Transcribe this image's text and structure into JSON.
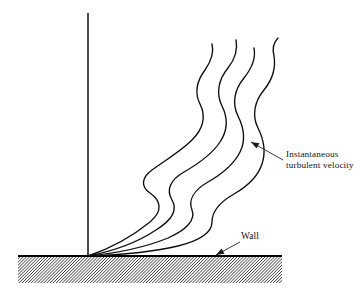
{
  "figure": {
    "background_color": "#ffffff",
    "ink_color": "#111111",
    "width": 362,
    "height": 295
  },
  "annotations": {
    "velocity_label": {
      "line1": "Instantaneous",
      "line2": "turbulent velocity",
      "text_x": 286,
      "text_y_line1": 157,
      "text_y_line2": 168,
      "leader_from_x": 283,
      "leader_from_y": 160,
      "leader_to_x": 251,
      "leader_to_y": 142,
      "arrow_angle_deg": 208
    },
    "wall_label": {
      "text": "Wall",
      "text_x": 241,
      "text_y": 239,
      "leader_from_x": 240,
      "leader_from_y": 242,
      "leader_to_x": 216,
      "leader_to_y": 255,
      "arrow_angle_deg": 152
    }
  },
  "axis": {
    "name": "vertical-reference-axis",
    "x": 88,
    "y_top": 13,
    "y_bottom": 257,
    "stroke_width": 1.5
  },
  "wall": {
    "name": "wall-surface",
    "top_line_y": 256,
    "x_start": 18,
    "x_end": 282,
    "band_height": 27,
    "hatch_angle_deg": 45,
    "hatch_spacing": 3.1,
    "hatch_count": 112
  },
  "chart_data": {
    "type": "line",
    "xlabel": "",
    "ylabel": "",
    "grid": false,
    "legend": null,
    "origin": {
      "x": 88,
      "y": 256
    },
    "series": [
      {
        "name": "profile-1",
        "path": "M 88 256 C 112 248, 134 235, 150 222 C 164 210, 160 200, 150 193 C 141 187, 141 178, 152 170 C 164 161, 180 152, 192 140 C 204 128, 206 116, 200 104 C 195 94, 196 82, 205 70 C 212 60, 214 52, 212 44"
      },
      {
        "name": "profile-2",
        "path": "M 88 256 C 114 251, 138 242, 156 230 C 172 220, 178 210, 172 200 C 166 190, 170 180, 184 172 C 198 164, 212 154, 220 142 C 228 130, 228 118, 222 106 C 216 94, 218 80, 228 68 C 235 59, 238 50, 236 40"
      },
      {
        "name": "profile-3",
        "path": "M 88 256 C 118 253, 146 247, 168 238 C 186 230, 196 220, 192 210 C 188 200, 194 190, 208 182 C 222 174, 234 164, 240 152 C 246 140, 244 128, 238 116 C 232 104, 234 90, 244 78 C 252 68, 256 58, 254 48"
      },
      {
        "name": "profile-4",
        "path": "M 88 256 C 120 255, 152 252, 178 246 C 198 241, 212 233, 212 222 C 212 212, 220 202, 234 194 C 248 186, 258 176, 262 164 C 266 152, 264 140, 258 128 C 252 116, 254 102, 264 90 C 272 80, 276 68, 274 56 C 272 48, 274 42, 278 38"
      }
    ]
  }
}
